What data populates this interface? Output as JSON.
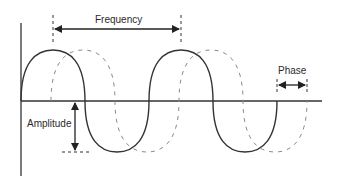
{
  "diagram": {
    "labels": {
      "frequency": "Frequency",
      "phase": "Phase",
      "amplitude": "Amplitude"
    },
    "series": [
      {
        "name": "reference-wave",
        "style": "solid",
        "color": "#333333"
      },
      {
        "name": "phase-shifted-wave",
        "style": "dashed",
        "color": "#8a8a8a"
      }
    ]
  }
}
